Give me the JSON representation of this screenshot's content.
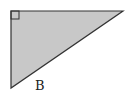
{
  "diagram": {
    "type": "right-triangle",
    "fill_color": "#c8c8c8",
    "stroke_color": "#333333",
    "vertices": {
      "right_angle": [
        11,
        11
      ],
      "top_right": [
        123,
        11
      ],
      "bottom_left": [
        11,
        88
      ]
    },
    "right_angle_marker": true,
    "labels": [
      {
        "text": "B",
        "x": 39,
        "y": 90
      }
    ]
  }
}
